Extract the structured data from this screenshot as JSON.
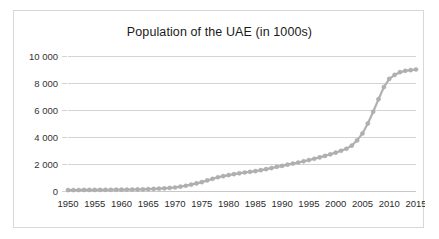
{
  "chart_data": {
    "type": "line",
    "title": "Population of the UAE (in 1000s)",
    "xlabel": "",
    "ylabel": "",
    "xlim": [
      1950,
      2015
    ],
    "ylim": [
      0,
      10000
    ],
    "grid": true,
    "legend": "none",
    "marker": "circle",
    "series_color": "#b0b0b0",
    "gridline_color": "#d4d4d4",
    "x_tick_labels": [
      "1950",
      "1955",
      "1960",
      "1965",
      "1970",
      "1975",
      "1980",
      "1985",
      "1990",
      "1995",
      "2000",
      "2005",
      "2010",
      "2015"
    ],
    "x_tick_values": [
      1950,
      1955,
      1960,
      1965,
      1970,
      1975,
      1980,
      1985,
      1990,
      1995,
      2000,
      2005,
      2010,
      2015
    ],
    "y_tick_labels": [
      "0",
      "2 000",
      "4 000",
      "6 000",
      "8 000",
      "10 000"
    ],
    "y_tick_values": [
      0,
      2000,
      4000,
      6000,
      8000,
      10000
    ],
    "x": [
      1950,
      1951,
      1952,
      1953,
      1954,
      1955,
      1956,
      1957,
      1958,
      1959,
      1960,
      1961,
      1962,
      1963,
      1964,
      1965,
      1966,
      1967,
      1968,
      1969,
      1970,
      1971,
      1972,
      1973,
      1974,
      1975,
      1976,
      1977,
      1978,
      1979,
      1980,
      1981,
      1982,
      1983,
      1984,
      1985,
      1986,
      1987,
      1988,
      1989,
      1990,
      1991,
      1992,
      1993,
      1994,
      1995,
      1996,
      1997,
      1998,
      1999,
      2000,
      2001,
      2002,
      2003,
      2004,
      2005,
      2006,
      2007,
      2008,
      2009,
      2010,
      2011,
      2012,
      2013,
      2014,
      2015
    ],
    "values": [
      70,
      72,
      74,
      76,
      79,
      82,
      85,
      88,
      91,
      95,
      100,
      105,
      110,
      116,
      123,
      135,
      150,
      170,
      195,
      225,
      260,
      320,
      390,
      470,
      560,
      660,
      780,
      900,
      1020,
      1100,
      1180,
      1250,
      1310,
      1370,
      1420,
      1470,
      1540,
      1620,
      1700,
      1790,
      1860,
      1950,
      2030,
      2110,
      2200,
      2290,
      2390,
      2490,
      2600,
      2720,
      2840,
      2980,
      3130,
      3360,
      3750,
      4260,
      5000,
      5870,
      6800,
      7700,
      8300,
      8600,
      8800,
      8900,
      8950,
      9000
    ],
    "source_note": ""
  }
}
